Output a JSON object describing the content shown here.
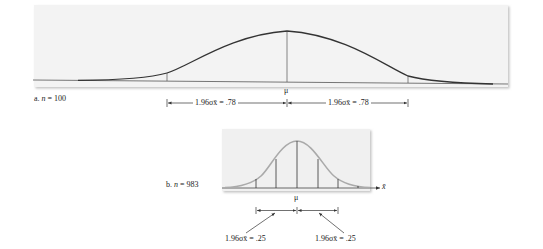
{
  "panel_a": {
    "label_prefix": "a.",
    "label_var": "n",
    "label_rest": "= 100",
    "mu_label": "μ",
    "left_bracket_label": "1.96σx̄ = .78",
    "right_bracket_label": "1.96σx̄ = .78"
  },
  "panel_b": {
    "label_prefix": "b.",
    "label_var": "n",
    "label_rest": "= 983",
    "mu_label": "μ",
    "axis_label": "x̄",
    "left_bracket_label": "1.96σx̄ = .25",
    "right_bracket_label": "1.96σx̄ = .25"
  },
  "colors": {
    "curve_a": "#333333",
    "curve_b": "#a8a8a8",
    "panel_bg": "#f2f2f2",
    "axis": "#444444"
  }
}
